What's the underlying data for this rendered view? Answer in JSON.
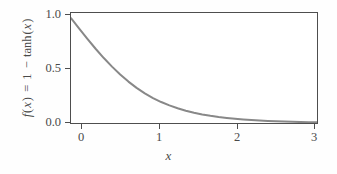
{
  "chart_data": {
    "type": "line",
    "title": "",
    "xlabel": "x",
    "ylabel": "f(x) = 1 − tanh(x)",
    "ylabel_parts": {
      "f": "f",
      "paren_open": "(",
      "var1": "x",
      "paren_close": ")",
      "equals": "=",
      "one": "1",
      "minus": "−",
      "func": "tanh",
      "paren_open2": "(",
      "var2": "x",
      "paren_close2": ")"
    },
    "xlim": [
      0,
      3
    ],
    "ylim": [
      0,
      1.05
    ],
    "xticks": [
      0,
      1,
      2,
      3
    ],
    "xtick_labels": [
      "0",
      "1",
      "2",
      "3"
    ],
    "yticks": [
      0.0,
      0.5,
      1.0
    ],
    "ytick_labels": [
      "0.0",
      "0.5",
      "1.0"
    ],
    "grid": false,
    "legend": false,
    "series": [
      {
        "name": "1 - tanh(x)",
        "color": "#888888",
        "linewidth": 2.0,
        "x": [
          0.0,
          0.1,
          0.2,
          0.3,
          0.4,
          0.5,
          0.6,
          0.7,
          0.8,
          0.9,
          1.0,
          1.1,
          1.2,
          1.3,
          1.4,
          1.5,
          1.6,
          1.7,
          1.8,
          1.9,
          2.0,
          2.1,
          2.2,
          2.3,
          2.4,
          2.5,
          2.6,
          2.7,
          2.8,
          2.9,
          3.0
        ],
        "values": [
          1.0,
          0.9003,
          0.8026,
          0.7087,
          0.6201,
          0.5379,
          0.4627,
          0.3951,
          0.3353,
          0.2832,
          0.2384,
          0.2002,
          0.1679,
          0.1407,
          0.1177,
          0.0983,
          0.0821,
          0.0685,
          0.0572,
          0.0477,
          0.0398,
          0.0332,
          0.0277,
          0.0231,
          0.0192,
          0.016,
          0.0134,
          0.0111,
          0.0093,
          0.0077,
          0.0065
        ]
      }
    ]
  },
  "figure": {
    "background_color": "#fefefe",
    "plot_background_color": "#ffffff",
    "axis_color": "#4e4e4e",
    "text_color": "#4a4a4a",
    "curve_color": "#888888"
  }
}
